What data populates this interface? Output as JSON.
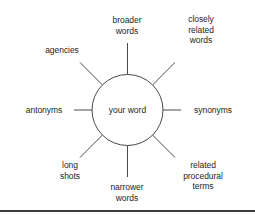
{
  "diagram": {
    "type": "radial-spoke-diagram",
    "center": {
      "label": "your word",
      "shape": "circle",
      "cx": 127.5,
      "cy": 110,
      "r": 35.5
    },
    "style": {
      "background": "#ffffff",
      "line_color": "#4a4a4a",
      "text_color": "#252525",
      "rule_color": "#3c3c3c"
    },
    "spokes": [
      {
        "id": "broader-words",
        "label": "broader\nwords",
        "angle_deg": 270,
        "label_x": 127,
        "label_y": 25,
        "line": {
          "x1": 127.5,
          "y1": 74.5,
          "x2": 127.5,
          "y2": 43
        }
      },
      {
        "id": "closely-related-words",
        "label": "closely\nrelated\nwords",
        "angle_deg": 315,
        "label_x": 201,
        "label_y": 30,
        "line": {
          "x1": 152.6,
          "y1": 84.9,
          "x2": 175,
          "y2": 62.5
        }
      },
      {
        "id": "agencies",
        "label": "agencies",
        "angle_deg": 225,
        "label_x": 62,
        "label_y": 50,
        "line": {
          "x1": 102.4,
          "y1": 84.9,
          "x2": 80,
          "y2": 62.5
        }
      },
      {
        "id": "antonyms",
        "label": "antonyms",
        "angle_deg": 180,
        "label_x": 44,
        "label_y": 110,
        "line": {
          "x1": 92,
          "y1": 110,
          "x2": 74,
          "y2": 110
        }
      },
      {
        "id": "synonyms",
        "label": "synonyms",
        "angle_deg": 0,
        "label_x": 213,
        "label_y": 110,
        "line": {
          "x1": 163,
          "y1": 110,
          "x2": 181,
          "y2": 110
        }
      },
      {
        "id": "long-shots",
        "label": "long\nshots",
        "angle_deg": 135,
        "label_x": 70,
        "label_y": 170,
        "line": {
          "x1": 102.4,
          "y1": 135.1,
          "x2": 80,
          "y2": 157.5
        }
      },
      {
        "id": "narrower-words",
        "label": "narrower\nwords",
        "angle_deg": 90,
        "label_x": 127,
        "label_y": 192,
        "line": {
          "x1": 127.5,
          "y1": 145.5,
          "x2": 127.5,
          "y2": 177
        }
      },
      {
        "id": "related-procedural-terms",
        "label": "related\nprocedural\nterms",
        "angle_deg": 45,
        "label_x": 203,
        "label_y": 176,
        "line": {
          "x1": 152.6,
          "y1": 135.1,
          "x2": 175,
          "y2": 157.5
        }
      }
    ],
    "footer_rule": {
      "name": "horizontal-rule",
      "x1": 0,
      "y1": 211,
      "x2": 255,
      "y2": 211,
      "thickness": 2
    }
  }
}
